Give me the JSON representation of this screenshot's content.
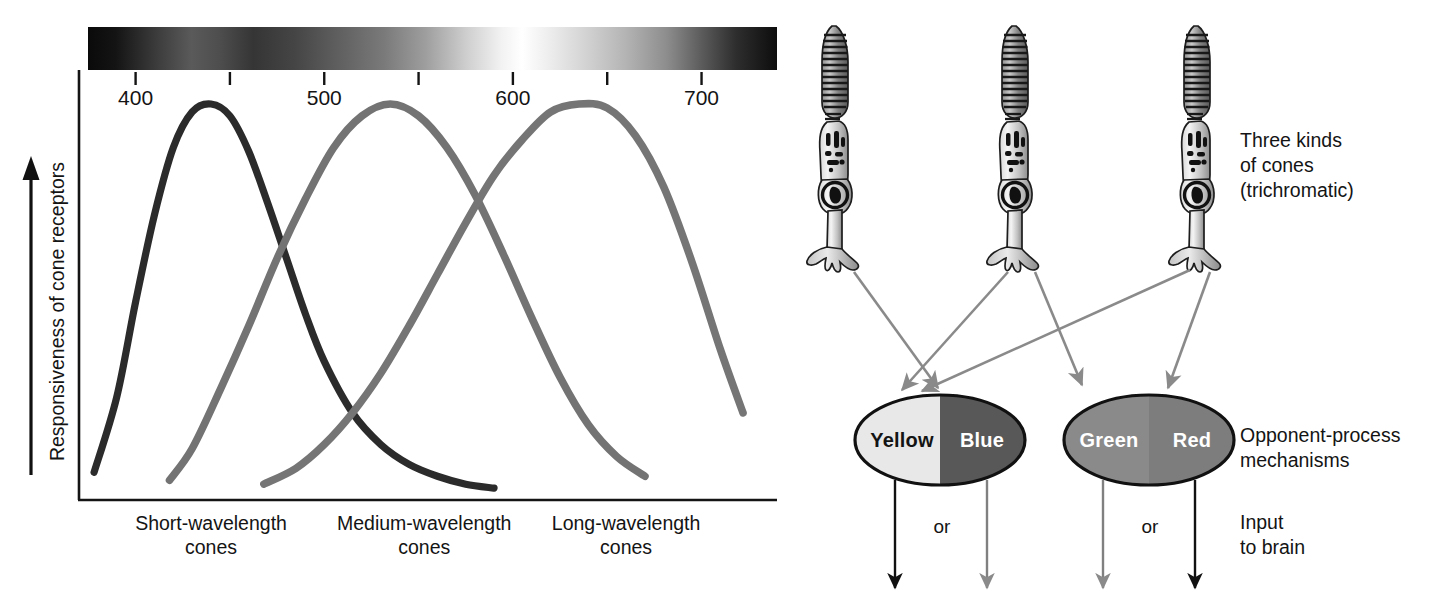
{
  "chart_data": {
    "type": "line",
    "title": "",
    "xlabel": "Wavelength (nanometers)",
    "ylabel": "Responsiveness of cone receptors",
    "xlim": [
      370,
      740
    ],
    "ylim": [
      0,
      1
    ],
    "grid": false,
    "legend": "none",
    "xticks": [
      400,
      450,
      500,
      550,
      600,
      650,
      700
    ],
    "xtick_labels": [
      "400",
      "",
      "500",
      "",
      "600",
      "",
      "700"
    ],
    "series": [
      {
        "name": "Short-wavelength cones",
        "color": "#2b2b2b",
        "peak_nm": 440,
        "x": [
          378,
          390,
          400,
          410,
          420,
          430,
          440,
          450,
          460,
          470,
          480,
          490,
          500,
          515,
          530,
          545,
          560,
          575,
          590
        ],
        "values": [
          0.07,
          0.26,
          0.5,
          0.72,
          0.89,
          0.98,
          1.0,
          0.97,
          0.88,
          0.75,
          0.61,
          0.47,
          0.35,
          0.22,
          0.14,
          0.09,
          0.06,
          0.04,
          0.03
        ]
      },
      {
        "name": "Medium-wavelength cones",
        "color": "#737373",
        "peak_nm": 535,
        "x": [
          418,
          430,
          445,
          460,
          475,
          490,
          505,
          520,
          535,
          550,
          565,
          580,
          595,
          610,
          625,
          640,
          655,
          670
        ],
        "values": [
          0.05,
          0.13,
          0.28,
          0.44,
          0.61,
          0.76,
          0.89,
          0.97,
          1.0,
          0.97,
          0.89,
          0.77,
          0.62,
          0.46,
          0.31,
          0.19,
          0.11,
          0.06
        ]
      },
      {
        "name": "Long-wavelength cones",
        "color": "#757575",
        "peak_nm": 645,
        "x": [
          468,
          485,
          500,
          515,
          530,
          545,
          560,
          575,
          590,
          605,
          620,
          635,
          650,
          665,
          680,
          695,
          710,
          722
        ],
        "values": [
          0.04,
          0.08,
          0.14,
          0.22,
          0.32,
          0.44,
          0.57,
          0.7,
          0.82,
          0.91,
          0.98,
          1.0,
          0.99,
          0.92,
          0.79,
          0.6,
          0.38,
          0.22
        ]
      }
    ],
    "x_category_labels": [
      {
        "line1": "Short-wavelength",
        "line2": "cones"
      },
      {
        "line1": "Medium-wavelength",
        "line2": "cones"
      },
      {
        "line1": "Long-wavelength",
        "line2": "cones"
      }
    ]
  },
  "diagram": {
    "cones": {
      "count": 3,
      "icon": "cone-photoreceptor-icon",
      "note": "Three kinds\nof cones\n(trichromatic)"
    },
    "opponent": {
      "note": "Opponent-process\nmechanisms",
      "channels": [
        {
          "name": "yellow-blue",
          "left_label": "Yellow",
          "right_label": "Blue",
          "left_fill": "#e8e8e8",
          "right_fill": "#585858",
          "left_text_color": "#141414",
          "right_text_color": "#ffffff"
        },
        {
          "name": "green-red",
          "left_label": "Green",
          "right_label": "Red",
          "left_fill": "#8a8a8a",
          "right_fill": "#7d7d7d",
          "left_text_color": "#ffffff",
          "right_text_color": "#ffffff"
        }
      ]
    },
    "output": {
      "note": "Input\nto brain",
      "or_label_left": "or",
      "or_label_right": "or",
      "arrow_colors": [
        "#111111",
        "#808080",
        "#808080",
        "#111111"
      ]
    },
    "colors": {
      "arrow_gray": "#8a8a8a",
      "axis_black": "#141414",
      "cell_fill_light": "#f0f0f0",
      "cell_fill_mid": "#b0b0b0",
      "cell_fill_dark": "#5d5d5d"
    }
  }
}
